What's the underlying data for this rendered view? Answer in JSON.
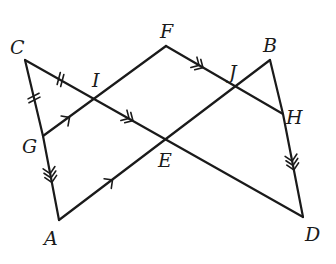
{
  "diagram": {
    "points": {
      "C": {
        "label": "C",
        "x": 25,
        "y": 60,
        "lx": 10,
        "ly": 54
      },
      "F": {
        "label": "F",
        "x": 166,
        "y": 46,
        "lx": 160,
        "ly": 38
      },
      "B": {
        "label": "B",
        "x": 270,
        "y": 60,
        "lx": 263,
        "ly": 52
      },
      "I": {
        "label": "I",
        "x": 96,
        "y": 99,
        "lx": 92,
        "ly": 87
      },
      "J": {
        "label": "J",
        "x": 236,
        "y": 87,
        "lx": 229,
        "ly": 79
      },
      "G": {
        "label": "G",
        "x": 43,
        "y": 136,
        "lx": 22,
        "ly": 153
      },
      "E": {
        "label": "E",
        "x": 166,
        "y": 140,
        "lx": 158,
        "ly": 167
      },
      "H": {
        "label": "H",
        "x": 283,
        "y": 114,
        "lx": 286,
        "ly": 124
      },
      "A": {
        "label": "A",
        "x": 59,
        "y": 220,
        "lx": 44,
        "ly": 245
      },
      "D": {
        "label": "D",
        "x": 303,
        "y": 217,
        "lx": 305,
        "ly": 241
      }
    },
    "segments": [
      {
        "name": "C-G",
        "from": "C",
        "to": "G"
      },
      {
        "name": "G-A",
        "from": "G",
        "to": "A"
      },
      {
        "name": "C-D",
        "from": "C",
        "to": "D"
      },
      {
        "name": "G-F",
        "from": "G",
        "to": "F"
      },
      {
        "name": "F-H",
        "from": "F",
        "to": "H"
      },
      {
        "name": "A-B",
        "from": "A",
        "to": "B"
      },
      {
        "name": "B-H",
        "from": "B",
        "to": "H"
      },
      {
        "name": "H-D",
        "from": "H",
        "to": "D"
      }
    ],
    "congruence_marks": [
      {
        "segment": "C-I",
        "ticks": 2
      },
      {
        "segment": "C-G",
        "ticks": 2
      }
    ],
    "parallel_marks": [
      {
        "segment": "G-I",
        "arrows": 1
      },
      {
        "segment": "A-E",
        "arrows": 1
      },
      {
        "segment": "I-E",
        "arrows": 2
      },
      {
        "segment": "F-J",
        "arrows": 2
      },
      {
        "segment": "G-A",
        "arrows": 3
      },
      {
        "segment": "H-D",
        "arrows": 3
      }
    ]
  }
}
